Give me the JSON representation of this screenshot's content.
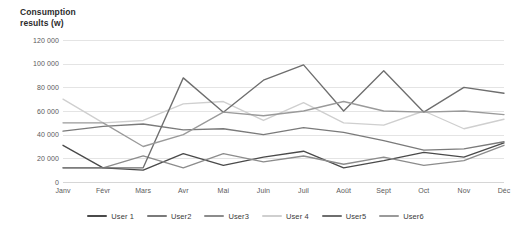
{
  "chart_data": {
    "type": "line",
    "title": "Consumption results (w)",
    "title_lines": [
      "Consumption",
      "results (w)"
    ],
    "xlabel": "",
    "ylabel": "",
    "ylim": [
      0,
      120000
    ],
    "ytick_values": [
      0,
      20000,
      40000,
      60000,
      80000,
      100000,
      120000
    ],
    "ytick_labels": [
      "0",
      "20 000",
      "40 000",
      "60 000",
      "80 000",
      "100 000",
      "120 000"
    ],
    "grid": true,
    "legend_position": "bottom",
    "categories": [
      "Janv",
      "Févr",
      "Mars",
      "Avr",
      "Mai",
      "Juin",
      "Juil",
      "Août",
      "Sept",
      "Oct",
      "Nov",
      "Déc"
    ],
    "series": [
      {
        "name": "User 1",
        "color": "#4a4a4a",
        "values": [
          31000,
          12000,
          10000,
          24000,
          14000,
          21000,
          26000,
          12000,
          18000,
          25000,
          21000,
          33000
        ]
      },
      {
        "name": "User2",
        "color": "#7a7a7a",
        "values": [
          43000,
          47000,
          49000,
          44000,
          45000,
          40000,
          46000,
          42000,
          35000,
          27000,
          28000,
          34000
        ]
      },
      {
        "name": "User3",
        "color": "#8c8c8c",
        "values": [
          12000,
          12000,
          22000,
          12000,
          24000,
          17000,
          22000,
          15000,
          21000,
          14000,
          18000,
          31000
        ]
      },
      {
        "name": "User 4",
        "color": "#cfcfcf",
        "values": [
          70000,
          50000,
          52000,
          66000,
          68000,
          52000,
          67000,
          50000,
          48000,
          60000,
          45000,
          53000
        ]
      },
      {
        "name": "User5",
        "color": "#6e6e6e",
        "values": [
          12000,
          12000,
          12000,
          88000,
          59000,
          86000,
          99000,
          60000,
          94000,
          59000,
          80000,
          75000
        ]
      },
      {
        "name": "User6",
        "color": "#9a9a9a",
        "values": [
          50000,
          50000,
          30000,
          40000,
          59000,
          56000,
          60000,
          68000,
          60000,
          59000,
          60000,
          57000
        ]
      }
    ]
  },
  "legend": {
    "items": [
      {
        "label": "User 1",
        "color": "#4a4a4a"
      },
      {
        "label": "User2",
        "color": "#7a7a7a"
      },
      {
        "label": "User3",
        "color": "#8c8c8c"
      },
      {
        "label": "User 4",
        "color": "#cfcfcf"
      },
      {
        "label": "User5",
        "color": "#6e6e6e"
      },
      {
        "label": "User6",
        "color": "#9a9a9a"
      }
    ]
  }
}
